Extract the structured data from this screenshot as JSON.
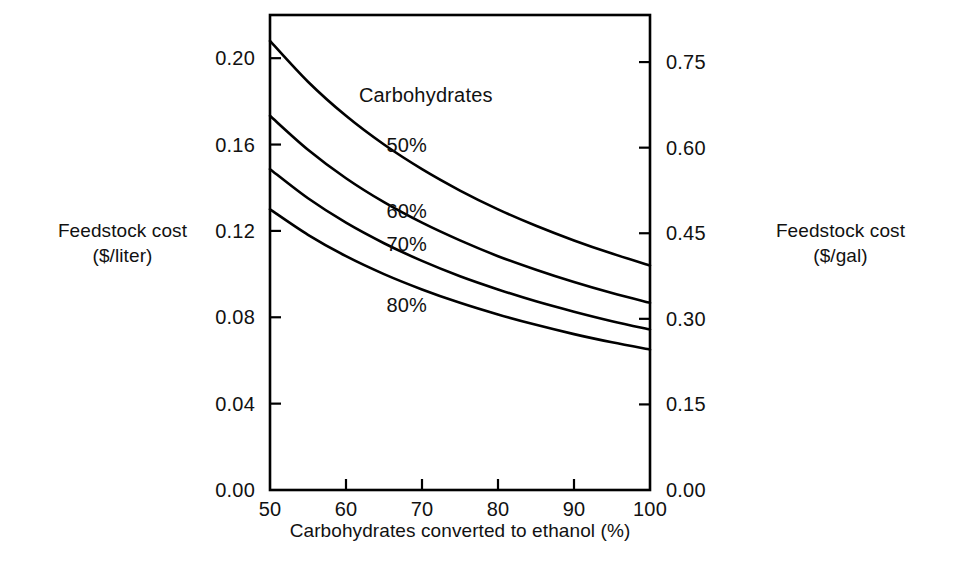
{
  "chart_data": {
    "type": "line",
    "title": "",
    "xlabel": "Carbohydrates converted to ethanol (%)",
    "ylabel_left": "Feedstock cost\n($/liter)",
    "ylabel_right": "Feedstock cost\n($/gal)",
    "xlim": [
      50,
      100
    ],
    "xticks": [
      50,
      60,
      70,
      80,
      90,
      100
    ],
    "xticklabels": [
      "50",
      "60",
      "70",
      "80",
      "90",
      "100"
    ],
    "ylim_left": [
      0.0,
      0.22
    ],
    "yticks_left": [
      0.0,
      0.04,
      0.08,
      0.12,
      0.16,
      0.2
    ],
    "yticklabels_left": [
      "0.00",
      "0.04",
      "0.08",
      "0.12",
      "0.16",
      "0.20"
    ],
    "ylim_right": [
      0.0,
      0.8325
    ],
    "yticks_right": [
      0.0,
      0.15,
      0.3,
      0.45,
      0.6,
      0.75
    ],
    "yticklabels_right": [
      "0.00",
      "0.15",
      "0.30",
      "0.45",
      "0.60",
      "0.75"
    ],
    "grid": false,
    "legend_position": "inline-curve-labels",
    "series_group_label": "Carbohydrates",
    "series": [
      {
        "name": "50%",
        "label": "50%",
        "x": [
          50,
          55,
          60,
          65,
          70,
          75,
          80,
          85,
          90,
          95,
          100
        ],
        "values": [
          0.208,
          0.1891,
          0.1733,
          0.16,
          0.1486,
          0.1387,
          0.13,
          0.1224,
          0.1156,
          0.1095,
          0.104
        ]
      },
      {
        "name": "60%",
        "label": "60%",
        "x": [
          50,
          55,
          60,
          65,
          70,
          75,
          80,
          85,
          90,
          95,
          100
        ],
        "values": [
          0.1733,
          0.1576,
          0.1444,
          0.1333,
          0.1238,
          0.1156,
          0.1083,
          0.102,
          0.0963,
          0.0912,
          0.0867
        ]
      },
      {
        "name": "70%",
        "label": "70%",
        "x": [
          50,
          55,
          60,
          65,
          70,
          75,
          80,
          85,
          90,
          95,
          100
        ],
        "values": [
          0.1486,
          0.1351,
          0.1238,
          0.1143,
          0.1061,
          0.099,
          0.0929,
          0.0874,
          0.0826,
          0.0782,
          0.0743
        ]
      },
      {
        "name": "80%",
        "label": "80%",
        "x": [
          50,
          55,
          60,
          65,
          70,
          75,
          80,
          85,
          90,
          95,
          100
        ],
        "values": [
          0.13,
          0.1182,
          0.1083,
          0.1,
          0.0929,
          0.0867,
          0.0813,
          0.0765,
          0.0722,
          0.0684,
          0.065
        ]
      }
    ],
    "annotations": [
      {
        "text": "Carbohydrates",
        "x": 70.5,
        "y_left": 0.183
      },
      {
        "text": "50%",
        "x": 68.0,
        "y_left": 0.16
      },
      {
        "text": "60%",
        "x": 68.0,
        "y_left": 0.129
      },
      {
        "text": "70%",
        "x": 68.0,
        "y_left": 0.1138
      },
      {
        "text": "80%",
        "x": 68.0,
        "y_left": 0.0856
      }
    ],
    "axis_color": "#000000",
    "curve_color": "#000000"
  },
  "caption": {
    "text": ""
  }
}
